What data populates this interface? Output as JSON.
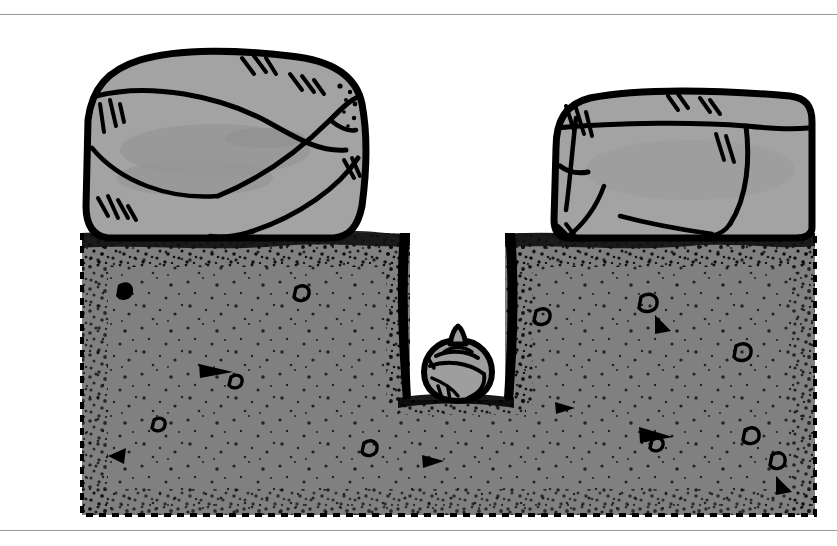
{
  "figure": {
    "title": "Cross-section of soil with boulders and a planted bulb",
    "type": "line-art-illustration",
    "caption": "",
    "frame": {
      "top_rule_y": 14,
      "bottom_rule_y": 530,
      "rule_color": "#9a9a9a",
      "background_color": "#ffffff"
    },
    "canvas": {
      "width": 837,
      "height": 546
    }
  },
  "palette": {
    "rock_fill": "#a3a3a3",
    "rock_shadow": "#949494",
    "soil_fill": "#808080",
    "soil_dark_band": "#111111",
    "bulb_fill": "#9e9e9e",
    "ink": "#000000",
    "paper": "#ffffff"
  },
  "elements": {
    "soil_block": {
      "label": "Soil cross-section block",
      "left_x": 82,
      "right_x": 815,
      "top_y": 233,
      "bottom_y": 515,
      "edge_style": "dashed-outline",
      "surface_style": "stippled-dark-band"
    },
    "trench": {
      "label": "Vertical planting trench",
      "left_x": 410,
      "right_x": 505,
      "top_y": 233,
      "bottom_y": 400,
      "fill": "#ffffff"
    },
    "rock_left": {
      "label": "Left boulder",
      "bounds": {
        "x": 82,
        "y": 52,
        "width": 285,
        "height": 185
      }
    },
    "rock_right": {
      "label": "Right boulder",
      "bounds": {
        "x": 548,
        "y": 90,
        "width": 267,
        "height": 148
      }
    },
    "bulb": {
      "label": "Bulb at bottom of trench",
      "center_x": 458,
      "center_y": 368,
      "radius_x": 33,
      "radius_y": 32,
      "neck": "pointed-tip-top"
    }
  }
}
